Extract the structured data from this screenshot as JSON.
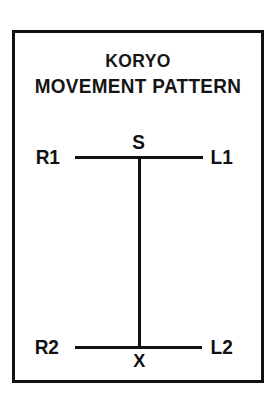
{
  "figure": {
    "title_line_1": "KORYO",
    "title_line_2": "MOVEMENT PATTERN",
    "frame_color": "#111111",
    "background_color": "#ffffff",
    "stroke_color": "#111111"
  },
  "diagram": {
    "nodes": [
      {
        "id": "r1",
        "label": "R1",
        "position": "top-left-endpoint"
      },
      {
        "id": "s",
        "label": "S",
        "position": "top-center-junction"
      },
      {
        "id": "l1",
        "label": "L1",
        "position": "top-right-endpoint"
      },
      {
        "id": "r2",
        "label": "R2",
        "position": "bottom-left-endpoint"
      },
      {
        "id": "x",
        "label": "X",
        "position": "bottom-center-junction"
      },
      {
        "id": "l2",
        "label": "L2",
        "position": "bottom-right-endpoint"
      }
    ],
    "edges": [
      {
        "id": "line-top",
        "from": "r1",
        "to": "l1",
        "orientation": "horizontal"
      },
      {
        "id": "line-bottom",
        "from": "r2",
        "to": "l2",
        "orientation": "horizontal"
      },
      {
        "id": "line-vertical",
        "from": "s",
        "to": "x",
        "orientation": "vertical"
      }
    ]
  }
}
